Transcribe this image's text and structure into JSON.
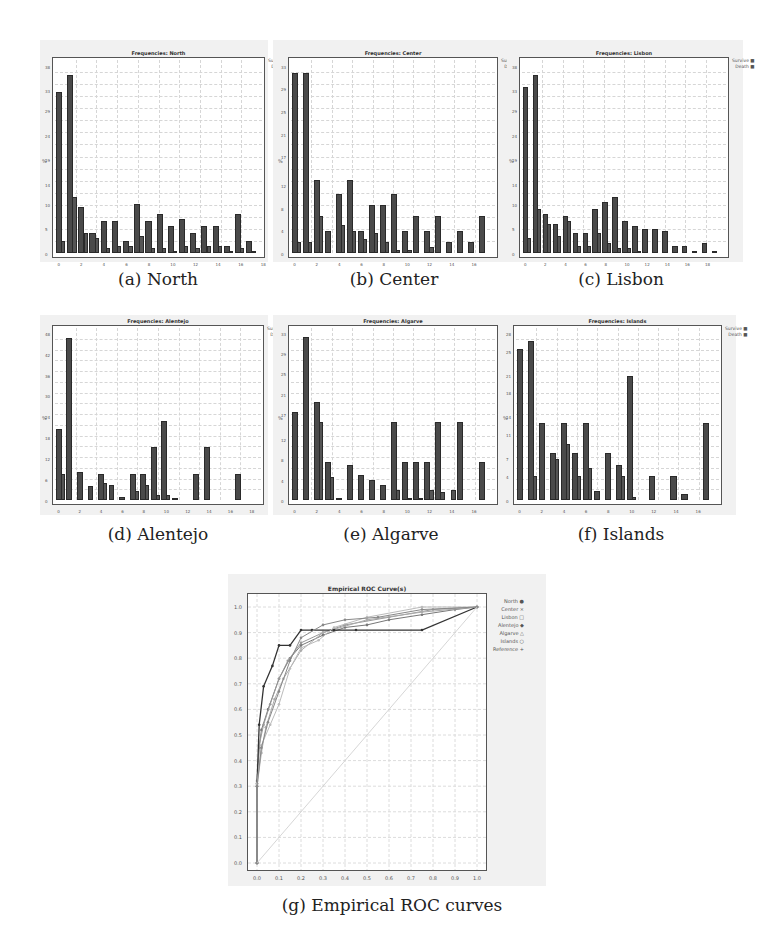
{
  "figure": {
    "captions": {
      "a": "(a) North",
      "b": "(b) Center",
      "c": "(c) Lisbon",
      "d": "(d) Alentejo",
      "e": "(e) Algarve",
      "f": "(f) Islands",
      "g": "(g) Empirical ROC curves"
    },
    "legend_freq": {
      "survive": "Survive",
      "death": "Death"
    },
    "ylabel": "%"
  },
  "chart_data": [
    {
      "id": "a",
      "type": "bar",
      "title": "Frequencies: North",
      "xlabel": "",
      "ylabel": "%",
      "x_ticks": [
        "0",
        "2",
        "4",
        "6",
        "8",
        "10",
        "12",
        "14",
        "16",
        "18"
      ],
      "categories": [
        "0",
        "1",
        "2",
        "3",
        "4",
        "5",
        "6",
        "7",
        "8",
        "9",
        "10",
        "11",
        "12",
        "13",
        "14",
        "15",
        "16",
        "17"
      ],
      "ylim": [
        0,
        38
      ],
      "series": [
        {
          "name": "Survive",
          "values": [
            2.5,
            11.5,
            4,
            3,
            1,
            1.5,
            1.5,
            3.5,
            1,
            1,
            0.5,
            1.5,
            1,
            1.5,
            1.5,
            0.5,
            1,
            0.5
          ]
        },
        {
          "name": "Death",
          "values": [
            33,
            36.5,
            9.5,
            4,
            6.5,
            6.5,
            2.5,
            10,
            6.5,
            8,
            5.5,
            7,
            4,
            5.5,
            5.5,
            1.5,
            8,
            2.5,
            1.5
          ]
        }
      ],
      "legend_position": "right"
    },
    {
      "id": "b",
      "type": "bar",
      "title": "Frequencies: Center",
      "xlabel": "",
      "ylabel": "%",
      "x_ticks": [
        "0",
        "2",
        "4",
        "6",
        "8",
        "10",
        "12",
        "14",
        "16"
      ],
      "categories": [
        "0",
        "1",
        "2",
        "3",
        "4",
        "5",
        "6",
        "7",
        "8",
        "9",
        "10",
        "11",
        "12",
        "13",
        "14",
        "15",
        "16",
        "17"
      ],
      "ylim": [
        0,
        33
      ],
      "series": [
        {
          "name": "Survive",
          "values": [
            2,
            2,
            6.5,
            0,
            5,
            4,
            2.5,
            3.5,
            2,
            0.5,
            0.5,
            0,
            1,
            0,
            0,
            0,
            0,
            0
          ]
        },
        {
          "name": "Death",
          "values": [
            32,
            32,
            13,
            4,
            10.5,
            13,
            4,
            8.5,
            8.5,
            10.5,
            4,
            6.5,
            4,
            6.5,
            2,
            4,
            2,
            6.5
          ]
        }
      ],
      "legend_position": "right"
    },
    {
      "id": "c",
      "type": "bar",
      "title": "Frequencies: Lisbon",
      "xlabel": "",
      "ylabel": "%",
      "x_ticks": [
        "0",
        "2",
        "4",
        "6",
        "8",
        "10",
        "12",
        "14",
        "16",
        "18"
      ],
      "categories": [
        "0",
        "1",
        "2",
        "3",
        "4",
        "5",
        "6",
        "7",
        "8",
        "9",
        "10",
        "11",
        "12",
        "13",
        "14",
        "15",
        "16",
        "17",
        "18",
        "19"
      ],
      "ylim": [
        0,
        38
      ],
      "series": [
        {
          "name": "Survive",
          "values": [
            3,
            9,
            6,
            3.5,
            6.5,
            1.5,
            1.5,
            4,
            2,
            1,
            1,
            0.5,
            0,
            0,
            0,
            0,
            0,
            0,
            0,
            0
          ]
        },
        {
          "name": "Death",
          "values": [
            34,
            36.5,
            8,
            6,
            7.5,
            4,
            4,
            9,
            10.5,
            11.5,
            6.5,
            5.5,
            5,
            5,
            4.5,
            1.5,
            1.5,
            0.5,
            2,
            0.5
          ]
        }
      ],
      "legend_position": "right"
    },
    {
      "id": "d",
      "type": "bar",
      "title": "Frequencies: Alentejo",
      "xlabel": "",
      "ylabel": "%",
      "x_ticks": [
        "0",
        "2",
        "4",
        "6",
        "8",
        "10",
        "12",
        "14",
        "16",
        "18"
      ],
      "categories": [
        "0",
        "1",
        "2",
        "3",
        "4",
        "5",
        "6",
        "7",
        "8",
        "9",
        "10",
        "11",
        "12",
        "13",
        "14",
        "15",
        "16",
        "17",
        "18"
      ],
      "ylim": [
        0,
        48
      ],
      "y_ticks": [
        "0",
        "5",
        "10",
        "15",
        "20",
        "25",
        "30",
        "35",
        "40",
        "45"
      ],
      "series": [
        {
          "name": "Survive",
          "values": [
            7.5,
            0,
            0,
            0,
            5,
            0,
            0,
            2.5,
            4.5,
            1.5,
            1.5,
            0,
            0,
            0,
            0,
            0,
            0,
            0,
            0
          ]
        },
        {
          "name": "Death",
          "values": [
            20.5,
            47,
            8,
            4,
            7.5,
            4.5,
            1,
            7.5,
            7.5,
            15.5,
            23,
            0.5,
            0,
            7.5,
            15.5,
            0,
            0,
            7.5
          ]
        }
      ],
      "legend_position": "right"
    },
    {
      "id": "e",
      "type": "bar",
      "title": "Frequencies: Algarve",
      "xlabel": "",
      "ylabel": "%",
      "x_ticks": [
        "0",
        "2",
        "4",
        "6",
        "8",
        "10",
        "12",
        "14",
        "16"
      ],
      "categories": [
        "0",
        "1",
        "2",
        "3",
        "4",
        "5",
        "6",
        "7",
        "8",
        "9",
        "10",
        "11",
        "12",
        "13",
        "14",
        "15",
        "16",
        "17"
      ],
      "ylim": [
        0,
        33
      ],
      "series": [
        {
          "name": "Survive",
          "values": [
            0,
            0,
            15.5,
            4.5,
            0,
            0,
            0,
            0,
            0,
            2,
            0.5,
            0.5,
            2,
            1.5,
            2,
            0,
            0,
            0
          ]
        },
        {
          "name": "Death",
          "values": [
            17.5,
            32.5,
            19.5,
            7.5,
            0.5,
            7,
            5,
            4,
            3,
            15.5,
            7.5,
            7.5,
            7.5,
            15.5,
            0,
            15.5,
            0,
            7.5
          ]
        }
      ],
      "legend_position": "right"
    },
    {
      "id": "f",
      "type": "bar",
      "title": "Frequencies: Islands",
      "xlabel": "",
      "ylabel": "%",
      "x_ticks": [
        "0",
        "2",
        "4",
        "6",
        "8",
        "10",
        "12",
        "14",
        "16"
      ],
      "categories": [
        "0",
        "1",
        "2",
        "3",
        "4",
        "5",
        "6",
        "7",
        "8",
        "9",
        "10",
        "11",
        "12",
        "13",
        "14",
        "15",
        "16",
        "17"
      ],
      "ylim": [
        0,
        28
      ],
      "series": [
        {
          "name": "Survive",
          "values": [
            0,
            4,
            0,
            7,
            9.5,
            4,
            5.5,
            0,
            0,
            4,
            0.5,
            0,
            0,
            0,
            0,
            0,
            0,
            0
          ]
        },
        {
          "name": "Death",
          "values": [
            25.5,
            27,
            13,
            8,
            13,
            8,
            13,
            1.5,
            8,
            6,
            21,
            0,
            4,
            0,
            4,
            1,
            0,
            13
          ]
        }
      ],
      "legend_position": "right"
    },
    {
      "id": "g",
      "type": "line",
      "title": "Empirical ROC Curve(s)",
      "xlabel": "",
      "ylabel": "",
      "xlim": [
        0,
        1
      ],
      "ylim": [
        0,
        1
      ],
      "x_ticks": [
        "0.0",
        "0.1",
        "0.2",
        "0.3",
        "0.4",
        "0.5",
        "0.6",
        "0.7",
        "0.8",
        "0.9",
        "1.0"
      ],
      "y_ticks": [
        "0.0",
        "0.1",
        "0.2",
        "0.3",
        "0.4",
        "0.5",
        "0.6",
        "0.7",
        "0.8",
        "0.9",
        "1.0"
      ],
      "grid": true,
      "legend_position": "right",
      "series": [
        {
          "name": "North",
          "x": [
            0,
            0,
            0.01,
            0.02,
            0.05,
            0.1,
            0.15,
            0.2,
            0.3,
            0.4,
            0.5,
            0.6,
            0.75,
            0.9,
            1.0
          ],
          "y": [
            0,
            0.3,
            0.45,
            0.52,
            0.6,
            0.72,
            0.8,
            0.85,
            0.89,
            0.92,
            0.93,
            0.95,
            0.97,
            0.99,
            1.0
          ]
        },
        {
          "name": "Center",
          "x": [
            0,
            0,
            0.01,
            0.03,
            0.06,
            0.1,
            0.14,
            0.2,
            0.3,
            0.4,
            0.6,
            0.8,
            1.0
          ],
          "y": [
            0,
            0.32,
            0.46,
            0.54,
            0.62,
            0.72,
            0.79,
            0.86,
            0.9,
            0.93,
            0.96,
            0.99,
            1.0
          ]
        },
        {
          "name": "Lisbon",
          "x": [
            0,
            0,
            0.02,
            0.04,
            0.08,
            0.12,
            0.2,
            0.3,
            0.5,
            0.75,
            1.0
          ],
          "y": [
            0,
            0.3,
            0.43,
            0.53,
            0.64,
            0.72,
            0.83,
            0.9,
            0.95,
            0.98,
            1.0
          ]
        },
        {
          "name": "Alentejo",
          "x": [
            0,
            0,
            0.01,
            0.03,
            0.07,
            0.1,
            0.15,
            0.2,
            0.25,
            0.35,
            0.45,
            0.75,
            1.0
          ],
          "y": [
            0,
            0.31,
            0.54,
            0.69,
            0.77,
            0.85,
            0.85,
            0.91,
            0.91,
            0.91,
            0.91,
            0.91,
            1.0
          ]
        },
        {
          "name": "Algarve",
          "x": [
            0,
            0,
            0.02,
            0.06,
            0.1,
            0.15,
            0.2,
            0.28,
            0.35,
            0.5,
            0.75,
            1.0
          ],
          "y": [
            0,
            0.31,
            0.46,
            0.54,
            0.62,
            0.76,
            0.84,
            0.87,
            0.92,
            0.96,
            1.0,
            1.0
          ]
        },
        {
          "name": "Islands",
          "x": [
            0,
            0,
            0.02,
            0.05,
            0.1,
            0.15,
            0.2,
            0.3,
            0.4,
            0.55,
            0.75,
            1.0
          ],
          "y": [
            0,
            0.3,
            0.45,
            0.55,
            0.67,
            0.79,
            0.88,
            0.93,
            0.95,
            0.96,
            0.99,
            1.0
          ]
        },
        {
          "name": "Reference",
          "x": [
            0,
            1
          ],
          "y": [
            0,
            1
          ]
        }
      ]
    }
  ]
}
